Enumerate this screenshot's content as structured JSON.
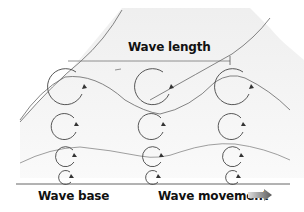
{
  "diagram": {
    "labels": {
      "wave_length": "Wave length",
      "wave_base": "Wave base",
      "wave_movement": "Wave movement"
    },
    "icons": {
      "direction": "right-arrow-icon"
    },
    "colors": {
      "line": "#555555",
      "shade": "#e6e6e6",
      "arrow_gradient_start": "#d8d8d8",
      "arrow_gradient_end": "#666666",
      "text": "#111111"
    },
    "columns": [
      {
        "x": 65,
        "orbits": [
          {
            "cy": 86,
            "r": 18
          },
          {
            "cy": 127,
            "r": 13
          },
          {
            "cy": 157,
            "r": 10
          },
          {
            "cy": 177,
            "r": 7
          }
        ]
      },
      {
        "x": 152,
        "orbits": [
          {
            "cy": 86,
            "r": 18
          },
          {
            "cy": 127,
            "r": 13
          },
          {
            "cy": 157,
            "r": 10
          },
          {
            "cy": 177,
            "r": 7
          }
        ]
      },
      {
        "x": 232,
        "orbits": [
          {
            "cy": 86,
            "r": 18
          },
          {
            "cy": 127,
            "r": 13
          },
          {
            "cy": 157,
            "r": 10
          },
          {
            "cy": 177,
            "r": 7
          }
        ]
      }
    ]
  }
}
